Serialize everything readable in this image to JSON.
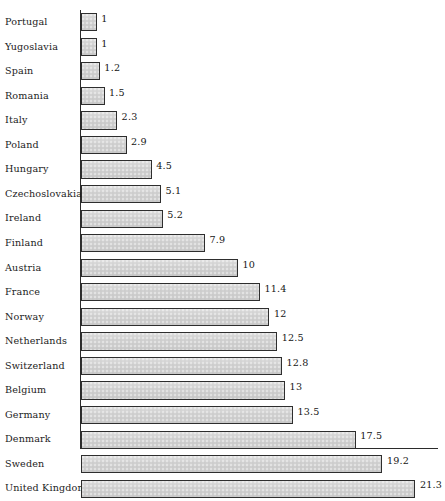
{
  "chart_data": {
    "type": "bar",
    "orientation": "horizontal",
    "title": "",
    "xlabel": "",
    "ylabel": "",
    "grid": false,
    "legend": "none",
    "xlim": [
      0,
      22.7
    ],
    "categories": [
      "Portugal",
      "Yugoslavia",
      "Spain",
      "Romania",
      "Italy",
      "Poland",
      "Hungary",
      "Czechoslovakia",
      "Ireland",
      "Finland",
      "Austria",
      "France",
      "Norway",
      "Netherlands",
      "Switzerland",
      "Belgium",
      "Germany",
      "Denmark",
      "Sweden",
      "United Kingdom"
    ],
    "values": [
      1,
      1,
      1.2,
      1.5,
      2.3,
      2.9,
      4.5,
      5.1,
      5.2,
      7.9,
      10,
      11.4,
      12,
      12.5,
      12.8,
      13,
      13.5,
      17.5,
      19.2,
      21.3
    ],
    "value_labels": [
      "1",
      "1",
      "1.2",
      "1.5",
      "2.3",
      "2.9",
      "4.5",
      "5.1",
      "5.2",
      "7.9",
      "10",
      "11.4",
      "12",
      "12.5",
      "12.8",
      "13",
      "13.5",
      "17.5",
      "19.2",
      "21.3"
    ],
    "bar_color": "#d2d2d2",
    "bar_border_color": "#2e2e2e",
    "axis_color": "#2b2b2b"
  }
}
